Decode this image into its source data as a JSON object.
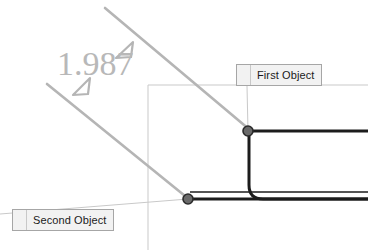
{
  "app": {
    "title": "CAD dimension annotation view",
    "background_color": "#ffffff"
  },
  "dimension": {
    "value_text": "1.987",
    "value_color": "#b8b8b8",
    "extension_line_color": "#b0b0b0",
    "arrow_marker_color": "#b0b0b0",
    "arrow_count": 2
  },
  "labels": {
    "first": {
      "text": "First Object",
      "grip_icon": "drag-grip-dots-icon",
      "fill_color": "#f2f2f2",
      "border_color": "#a6a6a6",
      "text_color": "#1a1a1a"
    },
    "second": {
      "text": "Second Object",
      "grip_icon": "drag-grip-dots-icon",
      "fill_color": "#f2f2f2",
      "border_color": "#a6a6a6",
      "text_color": "#1a1a1a"
    }
  },
  "geometry": {
    "profile_color": "#1c1c1c",
    "construction_color": "#bdbdbd",
    "leader_color": "#c4c4c4",
    "node_marker_color": "#555555",
    "node_count": 2,
    "nodes": [
      {
        "name": "first-object-node",
        "x": 248,
        "y": 131
      },
      {
        "name": "second-object-node",
        "x": 188,
        "y": 199
      }
    ]
  }
}
